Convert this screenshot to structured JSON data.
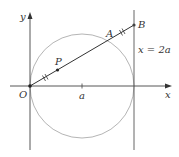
{
  "diagram": {
    "labels": {
      "y_axis": "y",
      "x_axis": "x",
      "origin": "O",
      "point_a_tick": "a",
      "point_P": "P",
      "point_A": "A",
      "point_B": "B",
      "vertical_line": "x = 2a"
    },
    "colors": {
      "axis": "#444444",
      "circle": "#b0b0b0",
      "segment": "#333333",
      "text": "#333333"
    }
  }
}
